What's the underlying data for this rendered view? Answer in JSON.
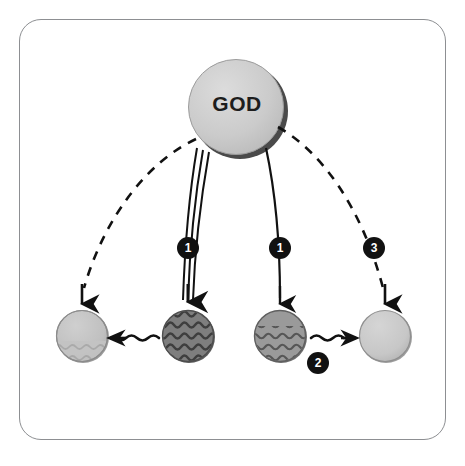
{
  "diagram": {
    "title_node": {
      "label": "GOD",
      "shape": "circle",
      "fill": "#c9c9c9",
      "shadow": "#4a4a4a",
      "cx": 236,
      "cy": 107,
      "r": 48
    },
    "badges": [
      {
        "id": "badge-1a",
        "label": "1",
        "cx": 188,
        "cy": 248,
        "fill": "#111111",
        "text_color": "#ffffff"
      },
      {
        "id": "badge-1b",
        "label": "1",
        "cx": 280,
        "cy": 248,
        "fill": "#111111",
        "text_color": "#ffffff"
      },
      {
        "id": "badge-3",
        "label": "3",
        "cx": 374,
        "cy": 248,
        "fill": "#111111",
        "text_color": "#ffffff"
      },
      {
        "id": "badge-2",
        "label": "2",
        "cx": 318,
        "cy": 363,
        "fill": "#111111",
        "text_color": "#ffffff"
      }
    ],
    "nodes": [
      {
        "id": "node-1",
        "name": "light-plain-circle-left",
        "cx": 82,
        "cy": 336,
        "r": 26,
        "fill": "#c3c3c3",
        "texture": "sparse-waves-bottom",
        "wave_color": "#8e8e8e"
      },
      {
        "id": "node-2",
        "name": "dark-wavy-circle-left",
        "cx": 188,
        "cy": 336,
        "r": 26,
        "fill": "#7e7e7e",
        "texture": "dense-waves-full",
        "wave_color": "#454545"
      },
      {
        "id": "node-3",
        "name": "medium-wavy-circle-right",
        "cx": 280,
        "cy": 336,
        "r": 26,
        "fill": "#9a9a9a",
        "texture": "waves-lower",
        "wave_color": "#5c5c5c"
      },
      {
        "id": "node-4",
        "name": "light-plain-circle-right",
        "cx": 385,
        "cy": 336,
        "r": 26,
        "fill": "#c9c9c9",
        "texture": "plain",
        "wave_color": "#c9c9c9"
      }
    ],
    "connectors": [
      {
        "id": "conn-dashed-left",
        "style": "dashed-curve",
        "from": "god",
        "to": "node-1",
        "arrow": "down",
        "color": "#111111"
      },
      {
        "id": "conn-triple-left",
        "style": "triple-line",
        "from": "god",
        "to": "node-2",
        "arrow": "down",
        "color": "#111111",
        "badge": "1"
      },
      {
        "id": "conn-single-right",
        "style": "single-line",
        "from": "god",
        "to": "node-3",
        "arrow": "down",
        "color": "#111111",
        "badge": "1"
      },
      {
        "id": "conn-dashed-right",
        "style": "dashed-curve",
        "from": "god",
        "to": "node-4",
        "arrow": "down",
        "color": "#111111",
        "badge": "3"
      },
      {
        "id": "conn-wavy-left",
        "style": "wavy-arrow",
        "from": "node-2",
        "to": "node-1",
        "direction": "left",
        "color": "#111111"
      },
      {
        "id": "conn-wavy-right",
        "style": "wavy-arrow",
        "from": "node-3",
        "to": "node-4",
        "direction": "right",
        "color": "#111111",
        "badge": "2"
      }
    ],
    "frame": {
      "stroke": "#8d8f92",
      "radius": 22,
      "fill": "#ffffff"
    },
    "background": "#ffffff"
  }
}
